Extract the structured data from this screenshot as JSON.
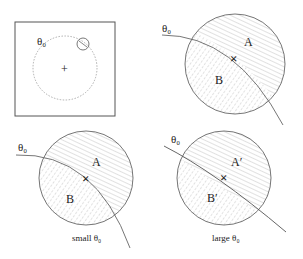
{
  "panels": [
    {
      "id": "overview",
      "theta_label": "θ₀",
      "center_marker": "+"
    },
    {
      "id": "top-right",
      "theta_label": "θ₀",
      "region_a": "A",
      "region_b": "B",
      "center_marker": "×"
    },
    {
      "id": "small-theta",
      "theta_label": "θ₀",
      "region_a": "A",
      "region_b": "B",
      "center_marker": "×",
      "caption": "small θ₀"
    },
    {
      "id": "large-theta",
      "theta_label": "θ₀",
      "region_a": "A′",
      "region_b": "B′",
      "center_marker": "×",
      "caption": "large θ₀"
    }
  ],
  "colors": {
    "stroke": "#555555",
    "dotted": "#9a9a9a",
    "hatch": "#b5b5b5",
    "text": "#222222"
  }
}
